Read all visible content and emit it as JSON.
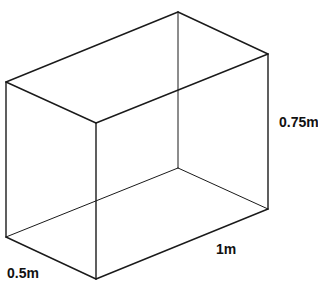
{
  "diagram": {
    "type": "rectangular-prism",
    "stroke_color": "#1a1a1a",
    "vertices": {
      "top_back": [
        178,
        12
      ],
      "top_left": [
        6,
        82
      ],
      "top_front": [
        96,
        123
      ],
      "top_right": [
        268,
        54
      ],
      "bottom_back": [
        178,
        168
      ],
      "bottom_left": [
        6,
        237
      ],
      "bottom_front": [
        96,
        279
      ],
      "bottom_right": [
        268,
        209
      ]
    },
    "labels": {
      "height": "0.75m",
      "length": "1m",
      "width": "0.5m"
    }
  }
}
